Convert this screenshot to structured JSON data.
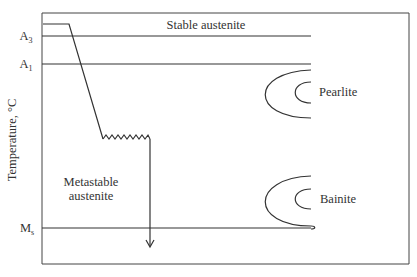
{
  "diagram": {
    "type": "TTT diagram (isothermal transformation)",
    "y_axis_label": "Temperature, °C",
    "levels": [
      {
        "id": "A3",
        "label": "A",
        "sub": "3"
      },
      {
        "id": "A1",
        "label": "A",
        "sub": "1"
      },
      {
        "id": "Ms",
        "label": "M",
        "sub": "s"
      }
    ],
    "regions": {
      "stable": "Stable austenite",
      "metastable_line1": "Metastable",
      "metastable_line2": "austenite",
      "pearlite": "Pearlite",
      "bainite": "Bainite"
    },
    "colors": {
      "line": "#333333",
      "background": "#ffffff"
    }
  }
}
